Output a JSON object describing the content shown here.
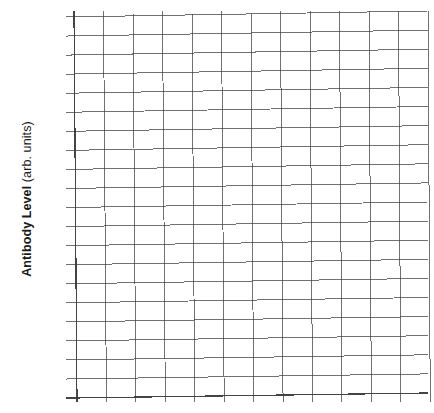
{
  "figure": {
    "kind": "blank-plot-grid",
    "background_color": "#ffffff",
    "ink_color": "#3a3a3a"
  },
  "axes": {
    "y_title_bold": "Antibody Level",
    "y_title_regular": "(arb. units)",
    "y_title_full": "Antibody Level (arb. units)",
    "x_title": "",
    "y_tick_labels": [],
    "x_tick_labels": []
  },
  "chart_data": {
    "type": "line",
    "title": "",
    "subtitle": "",
    "xlabel": "",
    "ylabel": "Antibody Level (arb. units)",
    "series": [],
    "categories": [],
    "x": [],
    "values": [],
    "annotations": [],
    "legend": [],
    "legend_position": "none",
    "grid": true,
    "grid_columns": 12,
    "grid_rows": 20,
    "xlim": [
      0,
      12
    ],
    "ylim": [
      0,
      20
    ],
    "x_tick_labels": [],
    "y_tick_labels": []
  }
}
